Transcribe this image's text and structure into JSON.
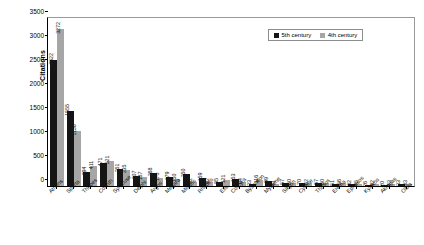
{
  "chart_data": {
    "type": "bar",
    "title": "",
    "xlabel": "",
    "ylabel": "Citations",
    "ylim": [
      0,
      3500
    ],
    "yticks": [
      0,
      500,
      1000,
      1500,
      2000,
      2500,
      3000,
      3500
    ],
    "grid": false,
    "legend_position": "top-right",
    "categories": [
      "Athens",
      "Sparta",
      "Thebes",
      "Corinth",
      "Syracuse",
      "Delphi",
      "Argos",
      "Megara",
      "Miletos",
      "Rhodes",
      "Elis",
      "Corcyra",
      "Byzantion",
      "Mytilene",
      "Sikyon",
      "Cyrene",
      "Thasos",
      "Eretria",
      "Ephesos",
      "Kyzikos",
      "Akragas",
      "Olbia"
    ],
    "series": [
      {
        "name": "5th century",
        "color": "#151515",
        "values": [
          2622,
          1555,
          294,
          471,
          351,
          207,
          268,
          179,
          250,
          159,
          85,
          153,
          33,
          99,
          57,
          70,
          57,
          51,
          32,
          26,
          20,
          33
        ]
      },
      {
        "name": "4th century",
        "color": "#a6a6a6",
        "values": [
          3272,
          1156,
          411,
          521,
          335,
          187,
          170,
          150,
          92,
          92,
          121,
          94,
          116,
          41,
          60,
          62,
          60,
          56,
          45,
          42,
          43,
          33
        ]
      }
    ]
  },
  "legend": {
    "items": [
      {
        "label": "5th century"
      },
      {
        "label": "4th century"
      }
    ]
  }
}
